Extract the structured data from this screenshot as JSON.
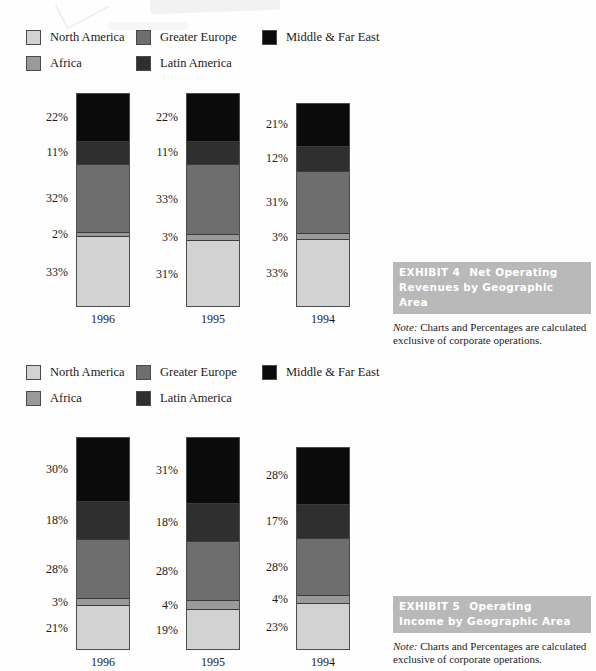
{
  "page": {
    "width": 596,
    "height": 671,
    "background": "#fefefe"
  },
  "palette": {
    "north_america": "#d2d2d2",
    "africa": "#9a9a9a",
    "greater_europe": "#6e6e6e",
    "latin_america": "#2f2f2f",
    "middle_far_east": "#0b0b0b",
    "band_background": "#b9b9b9",
    "band_text": "#ffffff",
    "outline": "#4d4d4d"
  },
  "legend": {
    "items": [
      {
        "key": "north_america",
        "label": "North America",
        "color": "#d2d2d2",
        "col": 1,
        "row": 1
      },
      {
        "key": "africa",
        "label": "Africa",
        "color": "#9a9a9a",
        "col": 1,
        "row": 2
      },
      {
        "key": "greater_europe",
        "label": "Greater Europe",
        "color": "#6e6e6e",
        "col": 2,
        "row": 1
      },
      {
        "key": "latin_america",
        "label": "Latin America",
        "color": "#2f2f2f",
        "col": 2,
        "row": 2
      },
      {
        "key": "middle_far_east",
        "label": "Middle & Far East",
        "color": "#0b0b0b",
        "col": 3,
        "row": 1
      }
    ]
  },
  "exhibits": [
    {
      "number_label": "EXHIBIT 4",
      "title": "Net Operating Revenues by Geographic Area",
      "title_line1": "Net Operating",
      "title_line2": "Revenues by Geographic Area",
      "note_word": "Note:",
      "note_text": "Charts and Percentages are calculated exclusive of corporate operations."
    },
    {
      "number_label": "EXHIBIT 5",
      "title": "Operating Income by Geographic Area",
      "title_line1": "Operating",
      "title_line2": "Income by Geographic Area",
      "note_word": "Note:",
      "note_text": "Charts and Percentages are calculated exclusive of corporate operations."
    }
  ],
  "chart_data": [
    {
      "type": "bar",
      "stacked": true,
      "title": "EXHIBIT 4  Net Operating Revenues by Geographic Area",
      "xlabel": "",
      "ylabel": "",
      "ylim": [
        0,
        100
      ],
      "grid": false,
      "legend_position": "top",
      "categories": [
        "1996",
        "1995",
        "1994"
      ],
      "series": [
        {
          "name": "North America",
          "color": "#d2d2d2",
          "values": [
            33,
            31,
            33
          ]
        },
        {
          "name": "Africa",
          "color": "#9a9a9a",
          "values": [
            2,
            3,
            3
          ]
        },
        {
          "name": "Greater Europe",
          "color": "#6e6e6e",
          "values": [
            32,
            33,
            31
          ]
        },
        {
          "name": "Latin America",
          "color": "#2f2f2f",
          "values": [
            11,
            11,
            12
          ]
        },
        {
          "name": "Middle & Far East",
          "color": "#0b0b0b",
          "values": [
            22,
            22,
            21
          ]
        }
      ],
      "data_labels": {
        "1996": [
          "22%",
          "11%",
          "32%",
          "2%",
          "33%"
        ],
        "1995": [
          "22%",
          "11%",
          "33%",
          "3%",
          "31%"
        ],
        "1994": [
          "21%",
          "12%",
          "31%",
          "3%",
          "33%"
        ]
      }
    },
    {
      "type": "bar",
      "stacked": true,
      "title": "EXHIBIT 5  Operating Income by Geographic Area",
      "xlabel": "",
      "ylabel": "",
      "ylim": [
        0,
        100
      ],
      "grid": false,
      "legend_position": "top",
      "categories": [
        "1996",
        "1995",
        "1994"
      ],
      "series": [
        {
          "name": "North America",
          "color": "#d2d2d2",
          "values": [
            21,
            19,
            23
          ]
        },
        {
          "name": "Africa",
          "color": "#9a9a9a",
          "values": [
            3,
            4,
            4
          ]
        },
        {
          "name": "Greater Europe",
          "color": "#6e6e6e",
          "values": [
            28,
            28,
            28
          ]
        },
        {
          "name": "Latin America",
          "color": "#2f2f2f",
          "values": [
            18,
            18,
            17
          ]
        },
        {
          "name": "Middle & Far East",
          "color": "#0b0b0b",
          "values": [
            30,
            31,
            28
          ]
        }
      ],
      "data_labels": {
        "1996": [
          "30%",
          "18%",
          "28%",
          "3%",
          "21%"
        ],
        "1995": [
          "31%",
          "18%",
          "28%",
          "4%",
          "19%"
        ],
        "1994": [
          "28%",
          "17%",
          "28%",
          "4%",
          "23%"
        ]
      }
    }
  ]
}
